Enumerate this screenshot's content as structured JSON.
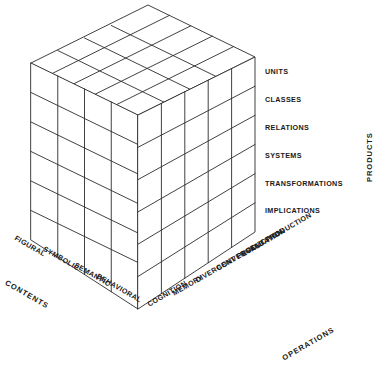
{
  "figure": {
    "background_color": "#ffffff",
    "line_color": "#2b2b2b",
    "text_color": "#1a1a1a"
  },
  "axes": {
    "products": {
      "label": "PRODUCTS",
      "orientation": "vertical-right",
      "categories": [
        "UNITS",
        "CLASSES",
        "RELATIONS",
        "SYSTEMS",
        "TRANSFORMATIONS",
        "IMPLICATIONS"
      ]
    },
    "contents": {
      "label": "CONTENTS",
      "orientation": "diagonal-lower-left",
      "categories": [
        "FIGURAL",
        "SYMBOLIC",
        "SEMANTIC",
        "BEHAVIORAL"
      ]
    },
    "operations": {
      "label": "OPERATIONS",
      "orientation": "diagonal-lower-right",
      "categories": [
        "COGNITION",
        "MEMORY",
        "DIVERGENT PRODUCTION",
        "CONVERGENT PRODUCTION",
        "EVALUATION"
      ]
    }
  },
  "cube": {
    "rows": 6,
    "contents_columns": 4,
    "operations_columns": 5,
    "total_cells": 120
  }
}
